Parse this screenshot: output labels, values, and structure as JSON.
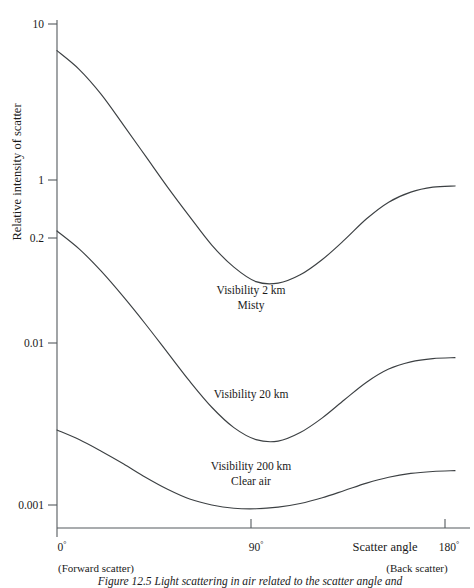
{
  "figure": {
    "caption": "Figure 12.5  Light scattering in air related to the scatter angle and"
  },
  "chart_data": {
    "type": "line",
    "title": "",
    "xlabel": "Scatter angle",
    "ylabel": "Relative intensity of scatter",
    "x_unit": "degrees",
    "xlim": [
      0,
      180
    ],
    "ylim": [
      0.0007,
      10
    ],
    "y_scale": "log",
    "grid": false,
    "legend": "inline-annotations",
    "x_ticks": [
      {
        "value": 0,
        "label": "0",
        "degree": "°",
        "sublabel": "(Forward scatter)"
      },
      {
        "value": 90,
        "label": "90",
        "degree": "°",
        "sublabel": ""
      },
      {
        "value": 180,
        "label": "180",
        "degree": "°",
        "sublabel": "(Back scatter)"
      }
    ],
    "y_ticks": [
      {
        "value": 10,
        "label": "10"
      },
      {
        "value": 1,
        "label": "1"
      },
      {
        "value": 0.2,
        "label": "0.2"
      },
      {
        "value": 0.01,
        "label": "0.01"
      },
      {
        "value": 0.001,
        "label": "0.001"
      }
    ],
    "series": [
      {
        "name": "Visibility 2 km",
        "annotation_line1": "Visibility 2 km",
        "annotation_line2": "Misty",
        "color": "#3c4043",
        "x": [
          0,
          10,
          20,
          30,
          40,
          50,
          60,
          70,
          80,
          90,
          100,
          110,
          120,
          130,
          140,
          150,
          160,
          170,
          180
        ],
        "y": [
          6.0,
          4.2,
          2.6,
          1.45,
          0.8,
          0.44,
          0.25,
          0.145,
          0.095,
          0.072,
          0.07,
          0.082,
          0.11,
          0.16,
          0.24,
          0.33,
          0.4,
          0.44,
          0.45
        ]
      },
      {
        "name": "Visibility 20 km",
        "annotation_line1": "Visibility 20 km",
        "annotation_line2": "",
        "color": "#3c4043",
        "x": [
          0,
          10,
          20,
          30,
          40,
          50,
          60,
          70,
          80,
          90,
          100,
          110,
          120,
          130,
          140,
          150,
          160,
          170,
          180
        ],
        "y": [
          0.19,
          0.135,
          0.088,
          0.054,
          0.032,
          0.0185,
          0.0107,
          0.0065,
          0.0044,
          0.0035,
          0.0034,
          0.004,
          0.0053,
          0.0075,
          0.0105,
          0.0135,
          0.0155,
          0.0165,
          0.0168
        ]
      },
      {
        "name": "Visibility 200 km",
        "annotation_line1": "Visibility 200 km",
        "annotation_line2": "Clear air",
        "color": "#3c4043",
        "x": [
          0,
          10,
          20,
          30,
          40,
          50,
          60,
          70,
          80,
          90,
          100,
          110,
          120,
          130,
          140,
          150,
          160,
          170,
          180
        ],
        "y": [
          0.0042,
          0.0035,
          0.0028,
          0.0022,
          0.0017,
          0.00135,
          0.00112,
          0.001,
          0.00094,
          0.00093,
          0.00096,
          0.00103,
          0.00115,
          0.00132,
          0.00152,
          0.0017,
          0.00183,
          0.0019,
          0.00193
        ]
      }
    ],
    "annotations": [
      {
        "text": "Visibility 2 km",
        "x": 90,
        "y_px": 294
      },
      {
        "text": "Misty",
        "x": 90,
        "y_px": 309
      },
      {
        "text": "Visibility 20 km",
        "x": 90,
        "y_px": 398
      },
      {
        "text": "Visibility 200 km",
        "x": 90,
        "y_px": 470
      },
      {
        "text": "Clear air",
        "x": 90,
        "y_px": 485
      }
    ]
  }
}
